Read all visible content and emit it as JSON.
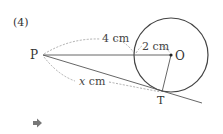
{
  "problem_number": "(4)",
  "points": {
    "P": "P",
    "O": "O",
    "T": "T"
  },
  "measures": {
    "PA_length": "4 cm",
    "radius": "2 cm",
    "PT_var": "x",
    "PT_unit": " cm"
  },
  "icons": {
    "answer_arrow": "right-arrow-icon"
  },
  "colors": {
    "line": "#555555",
    "dashed": "#999999",
    "circle": "#444444",
    "arrow": "#777777"
  }
}
